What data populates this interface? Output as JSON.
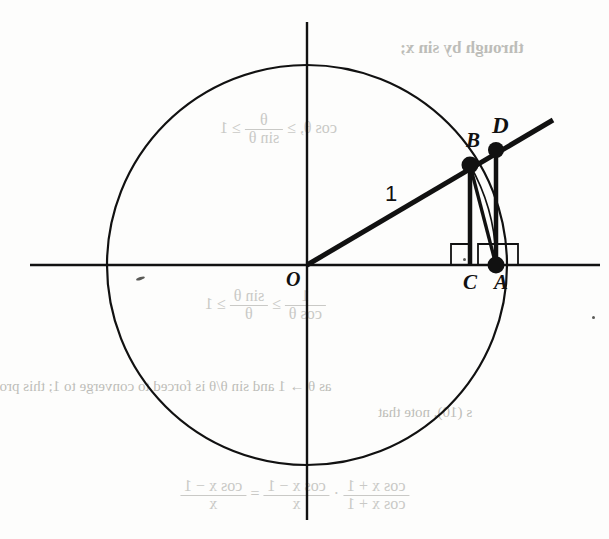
{
  "figure": {
    "background_color": "#fdfdfc",
    "ink_color": "#111111",
    "bleed_color": "#c9c9c6",
    "radius_label": "1",
    "point_labels": {
      "origin": "O",
      "b": "B",
      "d": "D",
      "c": "C",
      "a": "A"
    },
    "geometry": {
      "center": [
        307,
        265
      ],
      "radius": 200,
      "x_axis": [
        30,
        600
      ],
      "y_axis": [
        22,
        520
      ],
      "point_b": [
        470,
        165
      ],
      "point_d": [
        496,
        150
      ],
      "point_c": [
        470,
        265
      ],
      "point_a": [
        496,
        265
      ],
      "ray_end": [
        553,
        120
      ],
      "right_angle_marks": 2
    }
  },
  "bleed_through": {
    "line_top": "through by sin x;",
    "inequality_upper_left": "1",
    "inequality_upper_rel1": "≥",
    "inequality_upper_frac_num": "θ",
    "inequality_upper_frac_den": "sin θ",
    "inequality_upper_rel2": "≥",
    "inequality_upper_right": "cos θ,",
    "inequality_lower_left": "1",
    "inequality_lower_rel1": "≥",
    "inequality_lower_frac1_num": "sin θ",
    "inequality_lower_frac1_den": "θ",
    "inequality_lower_rel2": "≥",
    "inequality_lower_frac2_num": "1",
    "inequality_lower_frac2_den": "cos θ",
    "paragraph_line1": "as θ → 1 and sin θ/θ is forced to converge to 1; this prov",
    "paragraph_line2": "s (10), note that",
    "formula_lhs_num": "cos x − 1",
    "formula_lhs_den": "x",
    "formula_rel": "=",
    "formula_mid_num": "cos x − 1",
    "formula_mid_den": "x",
    "formula_dot": "·",
    "formula_rhs_num": "cos x + 1",
    "formula_rhs_den": "cos x + 1"
  }
}
